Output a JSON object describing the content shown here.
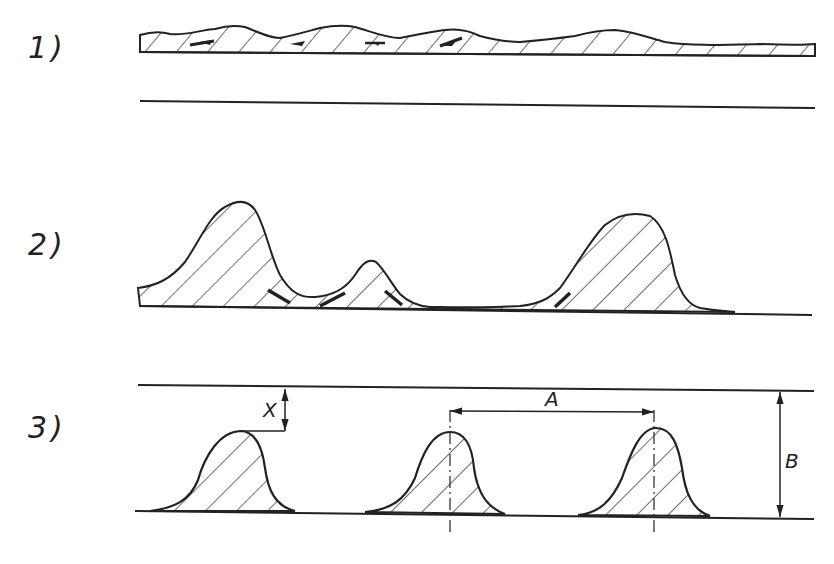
{
  "figures": [
    {
      "id": "1",
      "label": "1)"
    },
    {
      "id": "2",
      "label": "2)"
    },
    {
      "id": "3",
      "label": "3)"
    }
  ],
  "dimensions": {
    "x": "X",
    "a": "A",
    "b": "B"
  },
  "colors": {
    "ink": "#222222",
    "background": "#ffffff"
  }
}
